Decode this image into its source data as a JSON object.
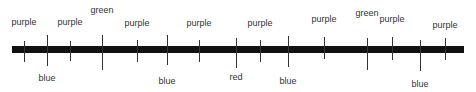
{
  "diagram": {
    "bar": {
      "x1": 12,
      "x2": 464,
      "y": 46,
      "height": 7,
      "color": "#111111"
    },
    "markers": [
      {
        "x": 24,
        "label": "purple",
        "side": "top",
        "tick_top": 41,
        "tick_bottom": 62,
        "label_y": 17
      },
      {
        "x": 47,
        "label": "blue",
        "side": "bottom",
        "tick_top": 35,
        "tick_bottom": 66,
        "label_y": 73
      },
      {
        "x": 70,
        "label": "purple",
        "side": "top",
        "tick_top": 41,
        "tick_bottom": 61,
        "label_y": 17
      },
      {
        "x": 102,
        "label": "green",
        "side": "top",
        "tick_top": 35,
        "tick_bottom": 70,
        "label_y": 5
      },
      {
        "x": 137,
        "label": "purple",
        "side": "top",
        "tick_top": 40,
        "tick_bottom": 62,
        "label_y": 18
      },
      {
        "x": 167,
        "label": "blue",
        "side": "bottom",
        "tick_top": 35,
        "tick_bottom": 65,
        "label_y": 76
      },
      {
        "x": 199,
        "label": "purple",
        "side": "top",
        "tick_top": 40,
        "tick_bottom": 62,
        "label_y": 18
      },
      {
        "x": 236,
        "label": "red",
        "side": "bottom",
        "tick_top": 38,
        "tick_bottom": 68,
        "label_y": 72
      },
      {
        "x": 260,
        "label": "purple",
        "side": "top",
        "tick_top": 40,
        "tick_bottom": 62,
        "label_y": 18
      },
      {
        "x": 288,
        "label": "blue",
        "side": "bottom",
        "tick_top": 36,
        "tick_bottom": 67,
        "label_y": 76
      },
      {
        "x": 324,
        "label": "purple",
        "side": "top",
        "tick_top": 37,
        "tick_bottom": 59,
        "label_y": 14
      },
      {
        "x": 367,
        "label": "green",
        "side": "top",
        "tick_top": 38,
        "tick_bottom": 70,
        "label_y": 8
      },
      {
        "x": 392,
        "label": "purple",
        "side": "top",
        "tick_top": 37,
        "tick_bottom": 60,
        "label_y": 14
      },
      {
        "x": 420,
        "label": "blue",
        "side": "bottom",
        "tick_top": 40,
        "tick_bottom": 71,
        "label_y": 79
      },
      {
        "x": 445,
        "label": "purple",
        "side": "top",
        "tick_top": 38,
        "tick_bottom": 60,
        "label_y": 20
      }
    ]
  }
}
